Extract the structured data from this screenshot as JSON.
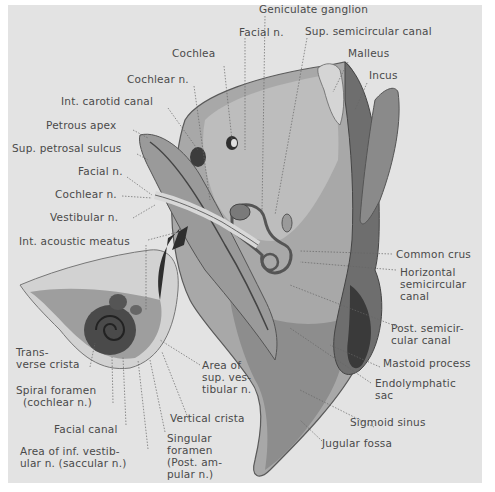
{
  "figure": {
    "background_color": "#e3e3e3",
    "ink_color": "#4a4a4a"
  },
  "labels": {
    "geniculate_ganglion": "Geniculate ganglion",
    "facial_n_top": "Facial n.",
    "sup_semicircular_canal": "Sup. semicircular canal",
    "cochlea": "Cochlea",
    "malleus": "Malleus",
    "incus": "Incus",
    "cochlear_n_top": "Cochlear n.",
    "int_carotid_canal": "Int. carotid canal",
    "petrous_apex": "Petrous apex",
    "sup_petrosal_sulcus": "Sup. petrosal sulcus",
    "facial_n_left": "Facial n.",
    "cochlear_n_left": "Cochlear n.",
    "vestibular_n": "Vestibular n.",
    "int_acoustic_meatus": "Int. acoustic meatus",
    "common_crus": "Common crus",
    "horizontal_semicircular_canal": "Horizontal\nsemicircular\ncanal",
    "post_semicircular_canal": "Post. semicir-\ncular canal",
    "mastoid_process": "Mastoid process",
    "endolymphatic_sac": "Endolymphatic\nsac",
    "sigmoid_sinus": "Sigmoid sinus",
    "jugular_fossa": "Jugular fossa",
    "transverse_crista": "Trans-\nverse crista",
    "area_sup_vestibular_n": "Area of\nsup. ves-\ntibular n.",
    "spiral_foramen": "Spiral foramen\n  (cochlear n.)",
    "vertical_crista": "Vertical crista",
    "facial_canal": "Facial canal",
    "singular_foramen": "Singular\nforamen\n(Post. am-\npular n.)",
    "area_inf_vestibular_n": "Area of inf. vestib-\nular n. (saccular n.)"
  }
}
